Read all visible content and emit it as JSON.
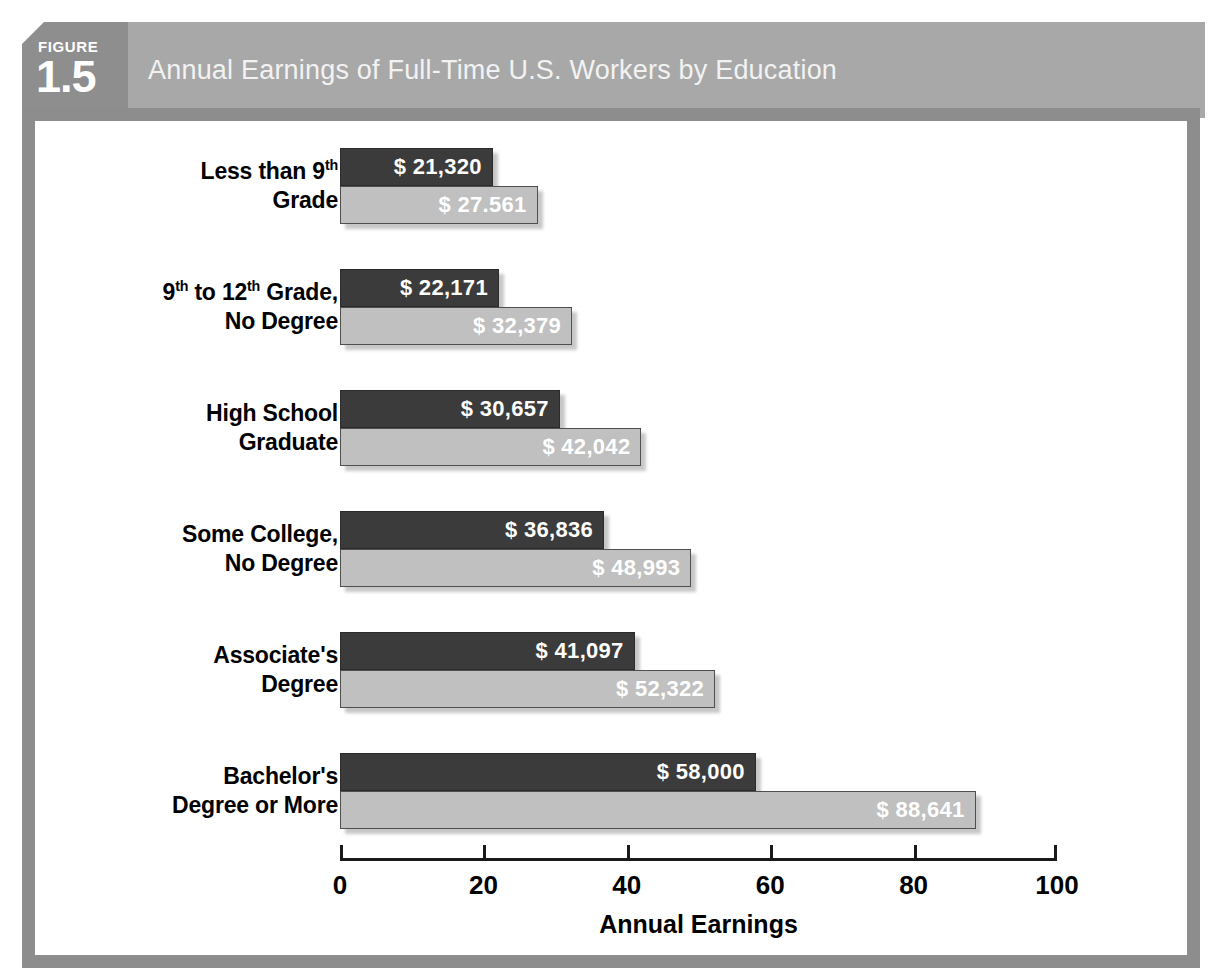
{
  "figure": {
    "word": "FIGURE",
    "number": "1.5",
    "title": "Annual Earnings of Full-Time U.S. Workers by Education"
  },
  "colors": {
    "header_band": "#a8a8a8",
    "figure_tab": "#8e8e8e",
    "frame_border": "#8d8d8d",
    "bar_dark": "#3b3b3b",
    "bar_light": "#c0c0c0",
    "axis": "#1a1a1a",
    "value_text": "#ffffff",
    "label_text": "#000000"
  },
  "chart_data": {
    "type": "bar",
    "orientation": "horizontal",
    "title": "Annual Earnings of Full-Time U.S. Workers by Education",
    "xlabel": "Annual Earnings",
    "ylabel": "",
    "xlim": [
      0,
      100
    ],
    "xticks": [
      0,
      20,
      40,
      60,
      80,
      100
    ],
    "xtick_labels": [
      "0",
      "20",
      "40",
      "60",
      "80",
      "100"
    ],
    "grid": false,
    "legend": false,
    "units": "thousands of dollars",
    "categories": [
      "Less than 9th Grade",
      "9th to 12th Grade, No Degree",
      "High School Graduate",
      "Some College, No Degree",
      "Associate's Degree",
      "Bachelor's Degree or More"
    ],
    "category_label_lines": [
      [
        "Less than 9|th| Grade"
      ],
      [
        "9|th| to 12|th| Grade,",
        "No Degree"
      ],
      [
        "High School",
        "Graduate"
      ],
      [
        "Some College,",
        "No Degree"
      ],
      [
        "Associate's",
        "Degree"
      ],
      [
        "Bachelor's",
        "Degree or More"
      ]
    ],
    "series": [
      {
        "name": "dark",
        "values": [
          21.32,
          22.171,
          30.657,
          36.836,
          41.097,
          58.0
        ],
        "labels": [
          "$ 21,320",
          "$ 22,171",
          "$ 30,657",
          "$ 36,836",
          "$ 41,097",
          "$ 58,000"
        ]
      },
      {
        "name": "light",
        "values": [
          27.561,
          32.379,
          42.042,
          48.993,
          52.322,
          88.641
        ],
        "labels": [
          "$ 27.561",
          "$ 32,379",
          "$ 42,042",
          "$ 48,993",
          "$ 52,322",
          "$ 88,641"
        ]
      }
    ]
  },
  "groups": [
    {
      "label_line1_pre": "Less than 9",
      "label_line1_sup": "th",
      "label_line1_post": "",
      "label_line2": "Grade",
      "dark_label": "$ 21,320",
      "light_label": "$ 27.561",
      "dark_value": 21.32,
      "light_value": 27.561
    },
    {
      "label_line1_pre": "9",
      "label_line1_sup": "th",
      "label_line1_post": " to 12",
      "label_line1_sup2": "th",
      "label_line1_post2": " Grade,",
      "label_line2": "No Degree",
      "dark_label": "$ 22,171",
      "light_label": "$ 32,379",
      "dark_value": 22.171,
      "light_value": 32.379
    },
    {
      "label_line1_pre": "High School",
      "label_line2": "Graduate",
      "dark_label": "$ 30,657",
      "light_label": "$ 42,042",
      "dark_value": 30.657,
      "light_value": 42.042
    },
    {
      "label_line1_pre": "Some College,",
      "label_line2": "No Degree",
      "dark_label": "$ 36,836",
      "light_label": "$ 48,993",
      "dark_value": 36.836,
      "light_value": 48.993
    },
    {
      "label_line1_pre": "Associate's",
      "label_line2": "Degree",
      "dark_label": "$ 41,097",
      "light_label": "$ 52,322",
      "dark_value": 41.097,
      "light_value": 52.322
    },
    {
      "label_line1_pre": "Bachelor's",
      "label_line2": "Degree or More",
      "dark_label": "$ 58,000",
      "light_label": "$ 88,641",
      "dark_value": 58.0,
      "light_value": 88.641
    }
  ],
  "axis": {
    "title": "Annual Earnings",
    "ticks": [
      "0",
      "20",
      "40",
      "60",
      "80",
      "100"
    ]
  }
}
